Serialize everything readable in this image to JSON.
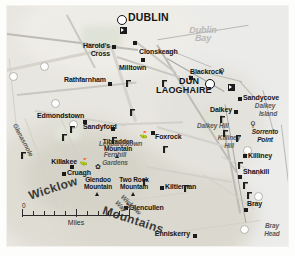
{
  "map": {
    "title": "Dublin and Wicklow Mountains area map",
    "colors": {
      "land": "#e8e6e0",
      "sea": "#ebebea",
      "road": "#c9c7c1",
      "label": "#141414",
      "water_label": "#b9b8b4",
      "physical_label": "#5c5a56"
    },
    "water_labels": [
      {
        "name": "dublin-bay",
        "text": "Dublin Bay",
        "x": 196,
        "y": 27
      }
    ],
    "cities": [
      {
        "name": "dublin",
        "text": "DUBLIN",
        "x": 124,
        "y": 14,
        "marker": "circle"
      },
      {
        "name": "dun-laoghaire-line1",
        "text": "DÚN",
        "x": 183,
        "y": 77,
        "marker": "circle"
      },
      {
        "name": "dun-laoghaire-line2",
        "text": "LAOGHAIRE",
        "x": 163,
        "y": 85
      }
    ],
    "towns": [
      {
        "name": "harolds-cross-line1",
        "text": "Harold's",
        "x": 69,
        "y": 40
      },
      {
        "name": "harolds-cross-line2",
        "text": "Cross",
        "x": 77,
        "y": 48
      },
      {
        "name": "clonskeagh",
        "text": "Clonskeagh",
        "x": 136,
        "y": 46
      },
      {
        "name": "milltown",
        "text": "Milltown",
        "x": 110,
        "y": 61
      },
      {
        "name": "rathfarnham",
        "text": "Rathfarnham",
        "x": 53,
        "y": 73
      },
      {
        "name": "blackrock",
        "text": "Blackrock",
        "x": 185,
        "y": 68
      },
      {
        "name": "sandycove",
        "text": "Sandycove",
        "x": 240,
        "y": 90
      },
      {
        "name": "dalkey",
        "text": "Dalkey",
        "x": 206,
        "y": 103
      },
      {
        "name": "edmondstown",
        "text": "Edmondstown",
        "x": 36,
        "y": 110
      },
      {
        "name": "sandyford",
        "text": "Sandyford",
        "x": 95,
        "y": 121
      },
      {
        "name": "foxrock",
        "text": "Foxrock",
        "x": 156,
        "y": 129
      },
      {
        "name": "killiney",
        "text": "Killiney",
        "x": 248,
        "y": 151
      },
      {
        "name": "killakee",
        "text": "Killakee",
        "x": 36,
        "y": 159
      },
      {
        "name": "cruagh",
        "text": "Cruagh",
        "x": 63,
        "y": 168
      },
      {
        "name": "shankill",
        "text": "Shankill",
        "x": 240,
        "y": 167
      },
      {
        "name": "kiltiernan",
        "text": "Kiltiernan",
        "x": 170,
        "y": 180
      },
      {
        "name": "glencullen",
        "text": "Glencullen",
        "x": 143,
        "y": 202
      },
      {
        "name": "bray",
        "text": "Bray",
        "x": 249,
        "y": 198
      },
      {
        "name": "enniskerry",
        "text": "Enniskerry",
        "x": 150,
        "y": 228
      }
    ],
    "peaks": [
      {
        "name": "tibradden-mountain",
        "text": "Tibradden\nMountain",
        "x": 108,
        "y": 142
      },
      {
        "name": "glendoo-mountain",
        "text": "Glendoo\nMountain",
        "x": 87,
        "y": 175
      },
      {
        "name": "two-rock-mountain",
        "text": "Two Rock\nMountain",
        "x": 124,
        "y": 180
      }
    ],
    "physical_labels": [
      {
        "name": "dalkey-island",
        "text": "Dalkey\nIsland",
        "x": 256,
        "y": 100
      },
      {
        "name": "dalkey-hill",
        "text": "Dalkey Hill",
        "x": 208,
        "y": 119
      },
      {
        "name": "killiney-hill",
        "text": "Killiney\nHill",
        "x": 222,
        "y": 131
      },
      {
        "name": "sorrento-point",
        "text": "Sorrento\nPoint",
        "x": 252,
        "y": 126
      },
      {
        "name": "bray-head",
        "text": "Bray\nHead",
        "x": 262,
        "y": 222
      },
      {
        "name": "fernhill-gardens",
        "text": "Fernhill\nGardens",
        "x": 105,
        "y": 150
      },
      {
        "name": "leopardstown",
        "text": "Leopardstown",
        "x": 110,
        "y": 137
      },
      {
        "name": "glenasmole",
        "text": "Glenasmole",
        "x": 25,
        "y": 150
      },
      {
        "name": "wicklow-way",
        "text": "Wicklow Way",
        "x": 128,
        "y": 190
      }
    ],
    "ranges": [
      {
        "name": "range-wicklow",
        "text": "Wicklow",
        "x": 30,
        "y": 191
      },
      {
        "name": "range-mountains",
        "text": "Mountains",
        "x": 120,
        "y": 207
      }
    ],
    "scale": {
      "name": "scale-bar",
      "min": "0",
      "max": "5",
      "units": "Miles",
      "ticks": 10
    }
  }
}
